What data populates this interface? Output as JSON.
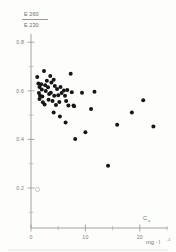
{
  "figure": {
    "name": "extinction-ratio-scatter",
    "background": "#fdfdfc",
    "ink_color": "#161616",
    "axis_color": "#8a8a86"
  },
  "yaxis": {
    "title_numerator": "E 260",
    "title_denominator": "E 230",
    "tick_labels": [
      "0.8",
      "0.6",
      "0.4",
      "0.2"
    ],
    "tick_values": [
      0.8,
      0.6,
      0.4,
      0.2
    ],
    "minor_tick_values": [
      0.7,
      0.5,
      0.3,
      0.1
    ],
    "limits": [
      0.0,
      0.88
    ]
  },
  "xaxis": {
    "title": "C",
    "title_subscript": "a",
    "units": "mg · l",
    "units_exponent": "-1",
    "tick_labels": [
      "0",
      "10",
      "20"
    ],
    "tick_values": [
      0,
      10,
      20
    ],
    "minor_tick_values": [
      5,
      15
    ],
    "limits": [
      0,
      24
    ]
  },
  "annotation": {
    "origin_marker_label": "0"
  },
  "chart_data": {
    "type": "scatter",
    "title": "",
    "xlabel": "Ca  (mg · l^-1)",
    "ylabel": "E260 / E230",
    "xlim": [
      0,
      24
    ],
    "ylim": [
      0.0,
      0.88
    ],
    "grid": false,
    "legend": "none",
    "marker": "filled-circle",
    "n_points": 48,
    "points": [
      {
        "x": 1.1,
        "y": 0.685
      },
      {
        "x": 1.3,
        "y": 0.655
      },
      {
        "x": 1.5,
        "y": 0.64
      },
      {
        "x": 1.4,
        "y": 0.612
      },
      {
        "x": 1.6,
        "y": 0.6
      },
      {
        "x": 1.5,
        "y": 0.585
      },
      {
        "x": 1.8,
        "y": 0.652
      },
      {
        "x": 1.9,
        "y": 0.628
      },
      {
        "x": 2.0,
        "y": 0.596
      },
      {
        "x": 2.1,
        "y": 0.57
      },
      {
        "x": 2.3,
        "y": 0.712
      },
      {
        "x": 2.5,
        "y": 0.648
      },
      {
        "x": 2.6,
        "y": 0.622
      },
      {
        "x": 2.4,
        "y": 0.56
      },
      {
        "x": 2.8,
        "y": 0.668
      },
      {
        "x": 3.0,
        "y": 0.638
      },
      {
        "x": 3.2,
        "y": 0.608
      },
      {
        "x": 3.1,
        "y": 0.582
      },
      {
        "x": 3.4,
        "y": 0.69
      },
      {
        "x": 3.6,
        "y": 0.66
      },
      {
        "x": 3.5,
        "y": 0.614
      },
      {
        "x": 3.8,
        "y": 0.576
      },
      {
        "x": 4.0,
        "y": 0.672
      },
      {
        "x": 4.2,
        "y": 0.644
      },
      {
        "x": 4.1,
        "y": 0.6
      },
      {
        "x": 4.4,
        "y": 0.558
      },
      {
        "x": 4.0,
        "y": 0.524
      },
      {
        "x": 4.6,
        "y": 0.63
      },
      {
        "x": 4.8,
        "y": 0.602
      },
      {
        "x": 5.0,
        "y": 0.572
      },
      {
        "x": 5.2,
        "y": 0.64
      },
      {
        "x": 5.4,
        "y": 0.612
      },
      {
        "x": 5.1,
        "y": 0.506
      },
      {
        "x": 5.8,
        "y": 0.624
      },
      {
        "x": 6.0,
        "y": 0.6
      },
      {
        "x": 6.2,
        "y": 0.576
      },
      {
        "x": 6.4,
        "y": 0.626
      },
      {
        "x": 6.6,
        "y": 0.556
      },
      {
        "x": 6.1,
        "y": 0.478
      },
      {
        "x": 7.0,
        "y": 0.7
      },
      {
        "x": 7.2,
        "y": 0.616
      },
      {
        "x": 7.5,
        "y": 0.556
      },
      {
        "x": 7.6,
        "y": 0.552
      },
      {
        "x": 7.8,
        "y": 0.404
      },
      {
        "x": 9.0,
        "y": 0.614
      },
      {
        "x": 9.6,
        "y": 0.434
      },
      {
        "x": 10.6,
        "y": 0.54
      },
      {
        "x": 11.2,
        "y": 0.618
      },
      {
        "x": 13.6,
        "y": 0.282
      },
      {
        "x": 15.2,
        "y": 0.468
      },
      {
        "x": 17.8,
        "y": 0.524
      },
      {
        "x": 19.8,
        "y": 0.58
      },
      {
        "x": 21.6,
        "y": 0.46
      }
    ]
  }
}
